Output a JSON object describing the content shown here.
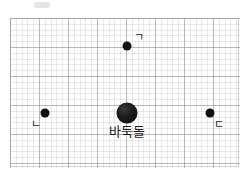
{
  "figure": {
    "title": "",
    "background_color": "#ffffff",
    "grid": {
      "visible": true,
      "style": "dotted-graph-paper",
      "minor_color": "#eeeef0",
      "major_color": "#dcdcdf",
      "minor_spacing_px": 5.8,
      "major_spacing_px": 29,
      "left": 10,
      "top": 18,
      "width": 230,
      "height": 150
    },
    "stone_color": "#111111"
  },
  "stones": [
    {
      "id": "stone-giyeok",
      "label": "ㄱ",
      "size": "small",
      "diameter_px": 9,
      "x": 127,
      "y": 46,
      "label_x": 134,
      "label_y": 32
    },
    {
      "id": "stone-nieun",
      "label": "ㄴ",
      "size": "small",
      "diameter_px": 9,
      "x": 45,
      "y": 113,
      "label_x": 31,
      "label_y": 119
    },
    {
      "id": "stone-center",
      "label": "바둑돌",
      "size": "large",
      "diameter_px": 21,
      "x": 127,
      "y": 113,
      "label_x": 127,
      "label_y": 125
    },
    {
      "id": "stone-digeut",
      "label": "ㄷ",
      "size": "small",
      "diameter_px": 9,
      "x": 210,
      "y": 113,
      "label_x": 214,
      "label_y": 119
    }
  ],
  "artifacts": [
    {
      "id": "scan-smudge-top",
      "x": 34,
      "y": 2,
      "width": 16,
      "height": 6
    }
  ]
}
